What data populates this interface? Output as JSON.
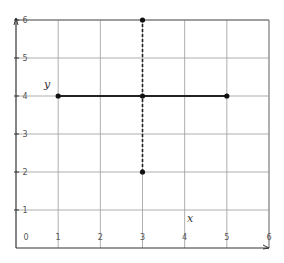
{
  "chart_data": {
    "type": "line",
    "title": "",
    "xlabel": "x",
    "ylabel": "y",
    "xlim": [
      0,
      6
    ],
    "ylim": [
      0,
      6
    ],
    "grid": true,
    "x_ticks": [
      "0",
      "1",
      "2",
      "3",
      "4",
      "5",
      "6"
    ],
    "y_ticks": [
      "1",
      "2",
      "3",
      "4",
      "5",
      "6"
    ],
    "series": [
      {
        "name": "horizontal segment y=4",
        "style": "solid",
        "points": [
          [
            1,
            4
          ],
          [
            3,
            4
          ],
          [
            5,
            4
          ]
        ]
      },
      {
        "name": "vertical dashed x=3",
        "style": "dashed",
        "points": [
          [
            3,
            2
          ],
          [
            3,
            6
          ]
        ]
      }
    ],
    "markers": [
      [
        1,
        4
      ],
      [
        3,
        4
      ],
      [
        5,
        4
      ],
      [
        3,
        2
      ],
      [
        3,
        6
      ]
    ]
  },
  "labels": {
    "x_axis": "x",
    "y_axis": "y"
  },
  "colors": {
    "grid": "#9a9a9a",
    "axis": "#333333",
    "line": "#222222",
    "marker": "#111111"
  }
}
